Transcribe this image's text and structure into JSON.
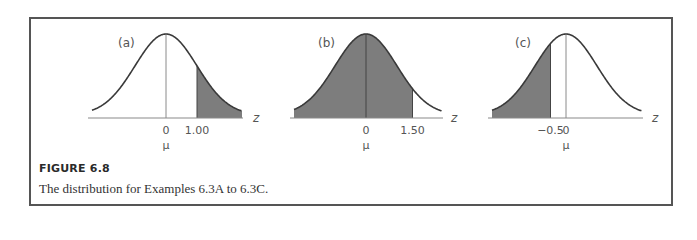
{
  "figure": {
    "heading": "FIGURE 6.8",
    "caption": "The distribution for Examples 6.3A to 6.3C."
  },
  "colors": {
    "shade": "#7d7d7d",
    "curve": "#3a3a3a",
    "axis": "#8a8a8a",
    "frame": "#555555"
  },
  "chart_data": [
    {
      "type": "area",
      "panel_label": "(a)",
      "title": "(a)",
      "xlabel": "z",
      "distribution": "standard normal",
      "xlim": [
        -3.0,
        3.0
      ],
      "tick_labels": [
        "0",
        "1.00"
      ],
      "tick_values": [
        0,
        1.0
      ],
      "mean_label": "μ",
      "shaded_region": {
        "from": 1.0,
        "to": "inf",
        "description": "right tail beyond z = 1.00"
      }
    },
    {
      "type": "area",
      "panel_label": "(b)",
      "title": "(b)",
      "xlabel": "z",
      "distribution": "standard normal",
      "xlim": [
        -3.0,
        3.0
      ],
      "tick_labels": [
        "0",
        "1.50"
      ],
      "tick_values": [
        0,
        1.5
      ],
      "mean_label": "μ",
      "shaded_region": {
        "from": "-inf",
        "to": 1.5,
        "description": "area left of z = 1.50"
      }
    },
    {
      "type": "area",
      "panel_label": "(c)",
      "title": "(c)",
      "xlabel": "z",
      "distribution": "standard normal",
      "xlim": [
        -3.0,
        3.0
      ],
      "tick_labels": [
        "−0.5",
        "0"
      ],
      "tick_values": [
        -0.5,
        0
      ],
      "mean_label": "μ",
      "shaded_region": {
        "from": "-inf",
        "to": -0.5,
        "description": "left tail below z = −0.5"
      }
    }
  ]
}
